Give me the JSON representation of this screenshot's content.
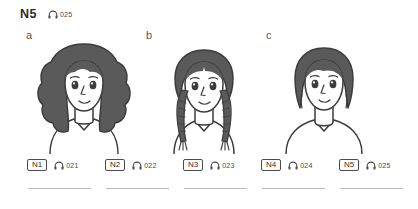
{
  "header": {
    "level": "N5",
    "audio_icon": "headphones-icon",
    "track": "025"
  },
  "figures": [
    {
      "label": "a",
      "name": "woman-curly-long-hair",
      "description": "young woman with voluminous long curly dark hair, v-neck top",
      "hair_style": "curly-long"
    },
    {
      "label": "b",
      "name": "woman-braided-pigtails",
      "description": "young woman with hair parted in the middle and two long braids",
      "hair_style": "braids"
    },
    {
      "label": "c",
      "name": "woman-short-bob",
      "description": "young woman with a short dark bob haircut, v-neck top",
      "hair_style": "short-bob"
    }
  ],
  "items": [
    {
      "question": "N1",
      "audio_icon": "headphones-icon",
      "track": "021"
    },
    {
      "question": "N2",
      "audio_icon": "headphones-icon",
      "track": "022"
    },
    {
      "question": "N3",
      "audio_icon": "headphones-icon",
      "track": "023"
    },
    {
      "question": "N4",
      "audio_icon": "headphones-icon",
      "track": "024"
    },
    {
      "question": "N5",
      "audio_icon": "headphones-icon",
      "track": "025"
    }
  ],
  "colors": {
    "hair": "#5a5a5a",
    "outline": "#3c3c3c",
    "text": "#3a3a3a",
    "rule": "#b9b9b9",
    "background": "#ffffff"
  }
}
